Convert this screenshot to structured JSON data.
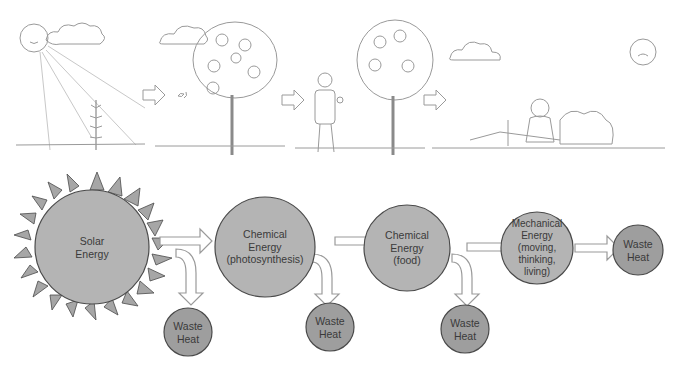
{
  "illustration": {
    "panels": [
      {
        "name": "sun-and-plant",
        "description": "Smiling sun with rays shining on a young plant"
      },
      {
        "name": "fruit-tree",
        "description": "Apple tree with butterflies"
      },
      {
        "name": "man-eating-apple",
        "description": "Man eating an apple next to an apple tree"
      },
      {
        "name": "tired-man",
        "description": "Sweating man resting after chopping wood, unhappy sun"
      }
    ]
  },
  "flow": {
    "nodes": [
      {
        "id": "solar",
        "lines": [
          "Solar",
          "Energy"
        ]
      },
      {
        "id": "chem1",
        "lines": [
          "Chemical",
          "Energy",
          "(photosynthesis)"
        ]
      },
      {
        "id": "chem2",
        "lines": [
          "Chemical",
          "Energy",
          "(food)"
        ]
      },
      {
        "id": "mech",
        "lines": [
          "Mechanical",
          "Energy",
          "(moving,",
          "thinking,",
          "living)"
        ]
      },
      {
        "id": "waste_final",
        "lines": [
          "Waste",
          "Heat"
        ]
      }
    ],
    "waste_nodes": [
      {
        "id": "waste1",
        "lines": [
          "Waste",
          "Heat"
        ]
      },
      {
        "id": "waste2",
        "lines": [
          "Waste",
          "Heat"
        ]
      },
      {
        "id": "waste3",
        "lines": [
          "Waste",
          "Heat"
        ]
      }
    ],
    "colors": {
      "node_fill": "#b4b4b4",
      "waste_fill": "#9e9e9e",
      "sun_ray_fill": "#a6a6a6",
      "outline": "#4a4a4a",
      "arrow_outline": "#9a9a9a"
    }
  }
}
